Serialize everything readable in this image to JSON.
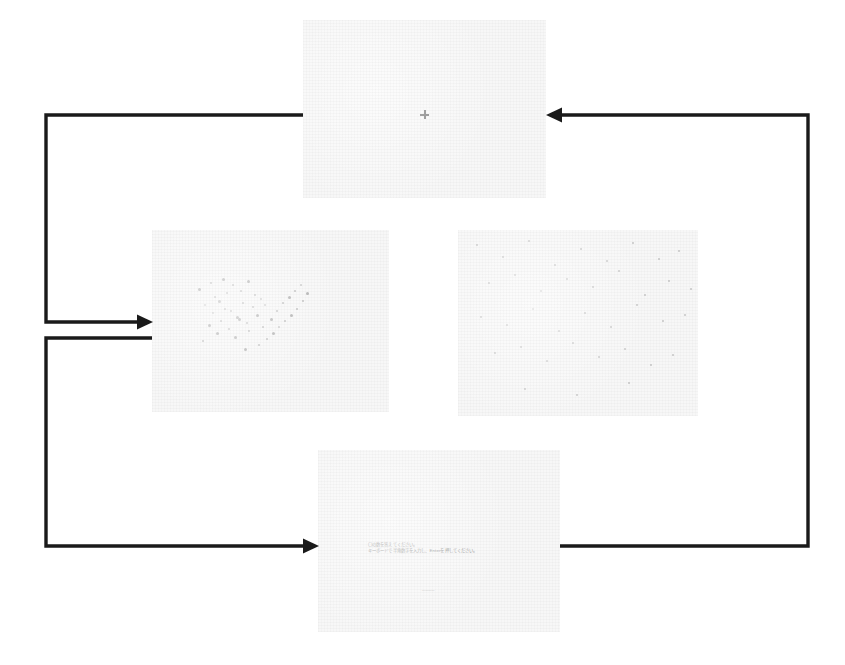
{
  "figure": {
    "background_color": "#ffffff",
    "panel_color": "#f7f7f7",
    "arrow_color": "#1a1a1a"
  },
  "panels": [
    {
      "id": "fixation-screen",
      "name": "fixation-panel",
      "order": 1,
      "x": 303,
      "y": 20,
      "width": 243,
      "height": 178,
      "content_type": "fixation-cross",
      "fixation": {
        "glyph": "+",
        "x": 117,
        "y": 90,
        "color": "#6f6f6f"
      }
    },
    {
      "id": "clustered-dots-screen",
      "name": "clustered-dot-stimulus-panel",
      "order": 2,
      "x": 152,
      "y": 230,
      "width": 237,
      "height": 182,
      "content_type": "dot-array-clustered",
      "dot_color": "#b9b9b9",
      "dot_count": 46
    },
    {
      "id": "scattered-dots-screen",
      "name": "scattered-dot-stimulus-panel",
      "order": 3,
      "x": 458,
      "y": 230,
      "width": 240,
      "height": 186,
      "content_type": "dot-array-scattered",
      "dot_color": "#c4c4c4",
      "dot_count": 38
    },
    {
      "id": "response-screen",
      "name": "response-prompt-panel",
      "order": 4,
      "x": 318,
      "y": 450,
      "width": 242,
      "height": 182,
      "content_type": "text-prompt",
      "prompt_line_1": "〇の数を答えてください。",
      "prompt_line_2": "キーボードで半角数字を入力し、Enterを押してください。",
      "answer_field_value": "____"
    }
  ],
  "connectors": [
    {
      "id": "fixation-to-clustered",
      "name": "arrow-fixation-to-clustered-dots",
      "from": "fixation-screen",
      "to": "clustered-dots-screen",
      "direction": "right",
      "style": "elbow"
    },
    {
      "id": "clustered-to-response",
      "name": "arrow-clustered-dots-to-response",
      "from": "clustered-dots-screen",
      "to": "response-screen",
      "direction": "right",
      "style": "elbow"
    },
    {
      "id": "response-to-fixation",
      "name": "arrow-response-to-fixation",
      "from": "response-screen",
      "to": "fixation-screen",
      "direction": "left",
      "style": "elbow"
    }
  ],
  "chart_data": {
    "type": "scatter",
    "xlabel": "",
    "ylabel": "",
    "legend": [],
    "series": [
      {
        "name": "clustered-dots",
        "panel": "clustered-dots-screen",
        "x": [
          46,
          58,
          62,
          70,
          74,
          52,
          66,
          80,
          88,
          95,
          60,
          72,
          84,
          90,
          102,
          56,
          68,
          78,
          86,
          100,
          108,
          64,
          76,
          94,
          104,
          112,
          50,
          82,
          96,
          110,
          118,
          124,
          130,
          136,
          142,
          148,
          92,
          106,
          114,
          120,
          126,
          132,
          138,
          144,
          150,
          154
        ],
        "y": [
          58,
          52,
          66,
          48,
          62,
          74,
          70,
          54,
          60,
          50,
          82,
          78,
          86,
          72,
          64,
          94,
          90,
          80,
          88,
          76,
          68,
          102,
          98,
          92,
          84,
          74,
          110,
          106,
          100,
          96,
          88,
          80,
          72,
          66,
          60,
          54,
          118,
          114,
          108,
          102,
          96,
          90,
          84,
          78,
          70,
          62
        ]
      },
      {
        "name": "scattered-dots",
        "panel": "scattered-dots-screen",
        "x": [
          18,
          44,
          70,
          96,
          122,
          148,
          174,
          200,
          220,
          30,
          56,
          82,
          108,
          134,
          160,
          186,
          210,
          232,
          22,
          48,
          74,
          100,
          126,
          152,
          178,
          204,
          226,
          36,
          62,
          88,
          114,
          140,
          166,
          192,
          214,
          66,
          118,
          170
        ],
        "y": [
          14,
          26,
          10,
          34,
          18,
          30,
          12,
          28,
          20,
          52,
          44,
          60,
          48,
          56,
          40,
          64,
          50,
          58,
          86,
          94,
          78,
          100,
          82,
          96,
          74,
          90,
          84,
          122,
          116,
          130,
          112,
          126,
          118,
          134,
          124,
          158,
          164,
          152
        ]
      }
    ]
  }
}
